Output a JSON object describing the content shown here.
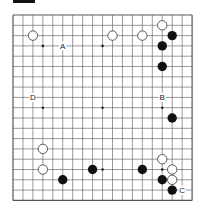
{
  "diagram": {
    "type": "go-board",
    "size": 19,
    "origin": {
      "x": 13,
      "y": 15
    },
    "spacing": {
      "x": 9.95,
      "y": 10.3
    },
    "colors": {
      "line": "#555555",
      "black": "#111111",
      "white_fill": "#ffffff",
      "white_stroke": "#333333",
      "background": "#ffffff"
    },
    "star_points": [
      [
        3,
        3
      ],
      [
        9,
        3
      ],
      [
        15,
        3
      ],
      [
        3,
        9
      ],
      [
        9,
        9
      ],
      [
        15,
        9
      ],
      [
        3,
        15
      ],
      [
        9,
        15
      ],
      [
        15,
        15
      ]
    ],
    "black_stones": [
      [
        16,
        2
      ],
      [
        15,
        3
      ],
      [
        15,
        5
      ],
      [
        16,
        10
      ],
      [
        5,
        16
      ],
      [
        8,
        15
      ],
      [
        13,
        15
      ],
      [
        15,
        16
      ],
      [
        16,
        17
      ]
    ],
    "white_stones": [
      [
        2,
        2
      ],
      [
        10,
        2
      ],
      [
        13,
        2
      ],
      [
        15,
        1
      ],
      [
        3,
        13
      ],
      [
        3,
        15
      ],
      [
        15,
        14
      ],
      [
        16,
        15
      ],
      [
        16,
        16
      ]
    ],
    "labels": [
      {
        "text": "A",
        "pos": [
          5,
          3
        ]
      },
      {
        "text": "B",
        "pos": [
          15,
          8
        ]
      },
      {
        "text": "C",
        "pos": [
          17,
          17
        ]
      },
      {
        "text": "D",
        "pos": [
          2,
          8
        ]
      }
    ]
  }
}
